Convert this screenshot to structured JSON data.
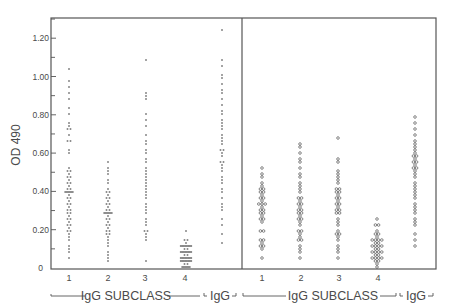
{
  "chart_data": {
    "type": "scatter",
    "subtype": "dot-strip (column scatter)",
    "title": "",
    "ylabel": "OD 490",
    "xlabel": "IgG SUBCLASS",
    "ylim": [
      0,
      1.3
    ],
    "yticks": [
      0,
      0.2,
      0.4,
      0.6,
      0.8,
      1.0,
      1.2
    ],
    "ytick_labels": [
      "0",
      "0.20",
      "0.40",
      "0.60",
      "0.80",
      "1.00",
      "1.20"
    ],
    "grid": false,
    "legend": null,
    "panels": [
      {
        "name": "left",
        "marker": "small dot / dash",
        "categories": [
          "1",
          "2",
          "3",
          "4",
          "IgG"
        ],
        "group_labels": [
          {
            "label": "IgG SUBCLASS",
            "spans": [
              "1",
              "2",
              "3",
              "4"
            ]
          },
          {
            "label": "IgG",
            "spans": [
              "IgG"
            ]
          }
        ],
        "series": [
          {
            "name": "1",
            "values": [
              1.04,
              0.97,
              0.95,
              0.91,
              0.88,
              0.84,
              0.8,
              0.76,
              0.74,
              0.73,
              0.72,
              0.7,
              0.67,
              0.66,
              0.62,
              0.6,
              0.52,
              0.51,
              0.5,
              0.49,
              0.48,
              0.47,
              0.46,
              0.45,
              0.44,
              0.43,
              0.42,
              0.41,
              0.4,
              0.4,
              0.39,
              0.38,
              0.37,
              0.36,
              0.35,
              0.34,
              0.33,
              0.32,
              0.31,
              0.3,
              0.29,
              0.28,
              0.27,
              0.26,
              0.25,
              0.24,
              0.23,
              0.22,
              0.21,
              0.2,
              0.19,
              0.18,
              0.16,
              0.14,
              0.12,
              0.1,
              0.08,
              0.06
            ]
          },
          {
            "name": "2",
            "values": [
              0.55,
              0.53,
              0.51,
              0.49,
              0.46,
              0.44,
              0.42,
              0.4,
              0.39,
              0.38,
              0.37,
              0.36,
              0.35,
              0.34,
              0.33,
              0.32,
              0.31,
              0.3,
              0.29,
              0.28,
              0.28,
              0.27,
              0.26,
              0.25,
              0.24,
              0.23,
              0.22,
              0.21,
              0.2,
              0.19,
              0.18,
              0.17,
              0.16,
              0.15,
              0.13,
              0.11,
              0.09,
              0.07,
              0.05,
              0.04
            ]
          },
          {
            "name": "3",
            "values": [
              1.08,
              0.92,
              0.9,
              0.88,
              0.8,
              0.78,
              0.74,
              0.7,
              0.67,
              0.64,
              0.62,
              0.6,
              0.57,
              0.55,
              0.53,
              0.51,
              0.49,
              0.48,
              0.46,
              0.45,
              0.43,
              0.41,
              0.4,
              0.38,
              0.36,
              0.34,
              0.32,
              0.3,
              0.28,
              0.26,
              0.24,
              0.22,
              0.2,
              0.19,
              0.18,
              0.16,
              0.14,
              0.04
            ]
          },
          {
            "name": "4",
            "values": [
              0.19,
              0.15,
              0.14,
              0.13,
              0.12,
              0.12,
              0.11,
              0.11,
              0.1,
              0.1,
              0.09,
              0.09,
              0.08,
              0.08,
              0.07,
              0.07,
              0.06,
              0.06,
              0.05,
              0.05,
              0.04,
              0.04,
              0.03,
              0.03,
              0.02,
              0.02,
              0.01,
              0.01,
              0.0
            ]
          },
          {
            "name": "IgG",
            "values": [
              1.24,
              1.08,
              1.05,
              1.01,
              1.0,
              0.96,
              0.93,
              0.91,
              0.88,
              0.85,
              0.82,
              0.8,
              0.78,
              0.76,
              0.74,
              0.72,
              0.7,
              0.68,
              0.66,
              0.64,
              0.62,
              0.61,
              0.6,
              0.58,
              0.56,
              0.55,
              0.54,
              0.52,
              0.5,
              0.48,
              0.46,
              0.45,
              0.42,
              0.4,
              0.36,
              0.34,
              0.32,
              0.3,
              0.26,
              0.22,
              0.17,
              0.13
            ]
          }
        ]
      },
      {
        "name": "right",
        "marker": "open circle",
        "categories": [
          "1",
          "2",
          "3",
          "4",
          "IgG"
        ],
        "group_labels": [
          {
            "label": "IgG SUBCLASS",
            "spans": [
              "1",
              "2",
              "3",
              "4"
            ]
          },
          {
            "label": "IgG",
            "spans": [
              "IgG"
            ]
          }
        ],
        "series": [
          {
            "name": "1",
            "values": [
              0.53,
              0.49,
              0.47,
              0.45,
              0.43,
              0.42,
              0.41,
              0.4,
              0.39,
              0.38,
              0.37,
              0.36,
              0.35,
              0.34,
              0.34,
              0.33,
              0.32,
              0.31,
              0.3,
              0.29,
              0.28,
              0.27,
              0.26,
              0.25,
              0.24,
              0.2,
              0.19,
              0.15,
              0.14,
              0.13,
              0.12,
              0.12,
              0.1,
              0.06
            ]
          },
          {
            "name": "2",
            "values": [
              0.64,
              0.63,
              0.6,
              0.57,
              0.55,
              0.52,
              0.49,
              0.47,
              0.45,
              0.43,
              0.41,
              0.39,
              0.37,
              0.36,
              0.35,
              0.34,
              0.33,
              0.32,
              0.31,
              0.3,
              0.29,
              0.28,
              0.27,
              0.26,
              0.25,
              0.24,
              0.22,
              0.2,
              0.19,
              0.18,
              0.16,
              0.15,
              0.14,
              0.12,
              0.1,
              0.08,
              0.05
            ]
          },
          {
            "name": "3",
            "values": [
              0.68,
              0.57,
              0.55,
              0.51,
              0.49,
              0.47,
              0.46,
              0.44,
              0.42,
              0.41,
              0.4,
              0.39,
              0.38,
              0.37,
              0.36,
              0.35,
              0.34,
              0.33,
              0.32,
              0.31,
              0.3,
              0.29,
              0.28,
              0.26,
              0.24,
              0.22,
              0.2,
              0.18,
              0.17,
              0.16,
              0.14,
              0.12,
              0.1,
              0.08,
              0.06
            ]
          },
          {
            "name": "4",
            "values": [
              0.26,
              0.23,
              0.22,
              0.2,
              0.18,
              0.17,
              0.16,
              0.15,
              0.15,
              0.14,
              0.14,
              0.13,
              0.13,
              0.12,
              0.12,
              0.11,
              0.11,
              0.1,
              0.1,
              0.09,
              0.09,
              0.08,
              0.08,
              0.07,
              0.07,
              0.06,
              0.06,
              0.05,
              0.05,
              0.04,
              0.03,
              0.02,
              0.01
            ]
          },
          {
            "name": "IgG",
            "values": [
              0.79,
              0.76,
              0.73,
              0.7,
              0.67,
              0.65,
              0.63,
              0.61,
              0.6,
              0.59,
              0.58,
              0.57,
              0.56,
              0.55,
              0.54,
              0.53,
              0.52,
              0.51,
              0.49,
              0.47,
              0.45,
              0.43,
              0.42,
              0.4,
              0.38,
              0.36,
              0.34,
              0.32,
              0.3,
              0.28,
              0.26,
              0.24,
              0.22,
              0.18,
              0.14,
              0.11
            ]
          }
        ]
      }
    ]
  },
  "axis": {
    "ylabel": "OD 490",
    "ytick_labels": [
      "0",
      "0.20",
      "0.40",
      "0.60",
      "0.80",
      "1.00",
      "1.20"
    ]
  },
  "left_panel": {
    "x_labels": [
      "1",
      "2",
      "3",
      "4"
    ],
    "group_label": "IgG SUBCLASS",
    "igg_label": "IgG"
  },
  "right_panel": {
    "x_labels": [
      "1",
      "2",
      "3",
      "4"
    ],
    "group_label": "IgG SUBCLASS",
    "igg_label": "IgG"
  }
}
